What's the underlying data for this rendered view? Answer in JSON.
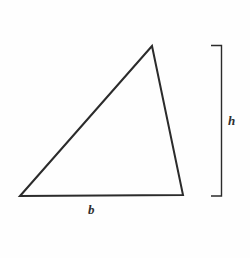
{
  "figure": {
    "background_color": "#fefefe",
    "stroke_color": "#2b2b2b",
    "label_color": "#2f2f2f",
    "width": 250,
    "height": 258
  },
  "shape": {
    "name": "triangle",
    "type": "polygon",
    "stroke_width": 2,
    "fill": "none",
    "vertices": [
      {
        "name": "bottom-left",
        "x": 20,
        "y": 196
      },
      {
        "name": "apex",
        "x": 152,
        "y": 46
      },
      {
        "name": "bottom-right",
        "x": 183,
        "y": 195
      }
    ],
    "points_attr": "20,196 152,46 183,195"
  },
  "bracket": {
    "name": "height-bracket",
    "orientation": "vertical",
    "stroke_width": 1.4,
    "spine_x": 221.5,
    "tick_x_start": 211,
    "top_y": 45.5,
    "bottom_y": 196,
    "path_attr": "M211,45.5 L221.5,45.5 L221.5,196 L211,196"
  },
  "labels": {
    "base": "b",
    "height": "h"
  }
}
